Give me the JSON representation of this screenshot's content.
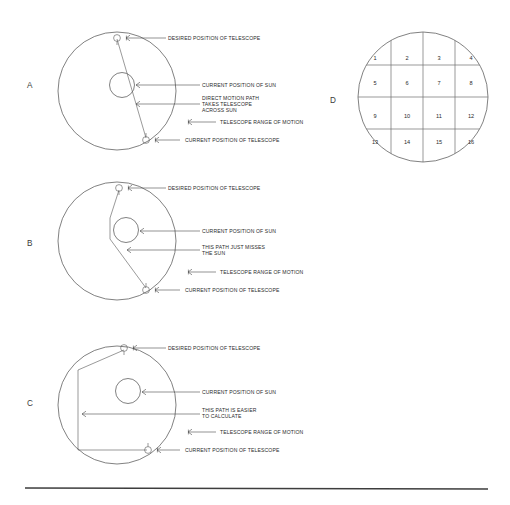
{
  "figure": {
    "background_color": "#ffffff",
    "line_color": "#4a4a4a",
    "text_color": "#2b2b2b"
  },
  "panels": [
    {
      "letter": "A",
      "labels": {
        "desired": "DESIRED POSITION OF TELESCOPE",
        "sun": "CURRENT POSITION OF SUN",
        "path_line1": "DIRECT MOTION PATH",
        "path_line2": "TAKES TELESCOPE",
        "path_line3": "ACROSS SUN",
        "range": "TELESCOPE RANGE OF MOTION",
        "current": "CURRENT POSITION OF TELESCOPE"
      }
    },
    {
      "letter": "B",
      "labels": {
        "desired": "DESIRED POSITION OF TELESCOPE",
        "sun": "CURRENT POSITION OF SUN",
        "path_line1": "THIS PATH JUST MISSES",
        "path_line2": "THE SUN",
        "range": "TELESCOPE RANGE OF MOTION",
        "current": "CURRENT POSITION OF TELESCOPE"
      }
    },
    {
      "letter": "C",
      "labels": {
        "desired": "DESIRED POSITION OF TELESCOPE",
        "sun": "CURRENT POSITION OF SUN",
        "path_line1": "THIS PATH  IS EASIER",
        "path_line2": "TO CALCULATE",
        "range": "TELESCOPE RANGE OF MOTION",
        "current": "CURRENT POSITION OF TELESCOPE"
      }
    },
    {
      "letter": "D",
      "grid_cells": [
        "1",
        "2",
        "3",
        "4",
        "5",
        "6",
        "7",
        "8",
        "9",
        "10",
        "11",
        "12",
        "13",
        "14",
        "15",
        "16"
      ]
    }
  ]
}
